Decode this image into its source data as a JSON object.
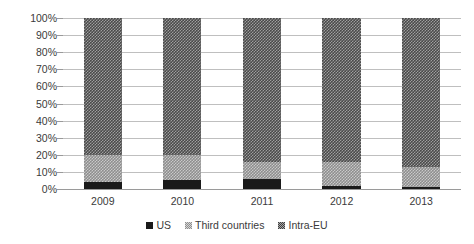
{
  "chart_data": {
    "type": "bar",
    "stacked": true,
    "stack_mode": "percent",
    "title": "",
    "subtitle": "",
    "xlabel": "",
    "ylabel": "",
    "categories": [
      "2009",
      "2010",
      "2011",
      "2012",
      "2013"
    ],
    "ytick_labels": [
      "100%",
      "90%",
      "80%",
      "70%",
      "60%",
      "50%",
      "40%",
      "30%",
      "20%",
      "10%",
      "0%"
    ],
    "ytick_values": [
      100,
      90,
      80,
      70,
      60,
      50,
      40,
      30,
      20,
      10,
      0
    ],
    "ylim": [
      0,
      100
    ],
    "grid": true,
    "grid_axis": "y",
    "legend_position": "bottom",
    "series": [
      {
        "name": "US",
        "color": "#1a1a1a",
        "pattern": "solid",
        "values": [
          4,
          5,
          6,
          2,
          1
        ]
      },
      {
        "name": "Third countries",
        "color": "#8e8e8e",
        "pattern": "checker-light",
        "values": [
          16,
          15,
          10,
          14,
          12
        ]
      },
      {
        "name": "Intra-EU",
        "color": "#4a4a4a",
        "pattern": "checker-dark",
        "values": [
          80,
          80,
          84,
          84,
          87
        ]
      }
    ]
  },
  "legend": {
    "items": [
      {
        "label": "US",
        "swatch_class": "sw-us"
      },
      {
        "label": "Third countries",
        "swatch_class": "sw-third"
      },
      {
        "label": "Intra-EU",
        "swatch_class": "sw-intra"
      }
    ]
  }
}
